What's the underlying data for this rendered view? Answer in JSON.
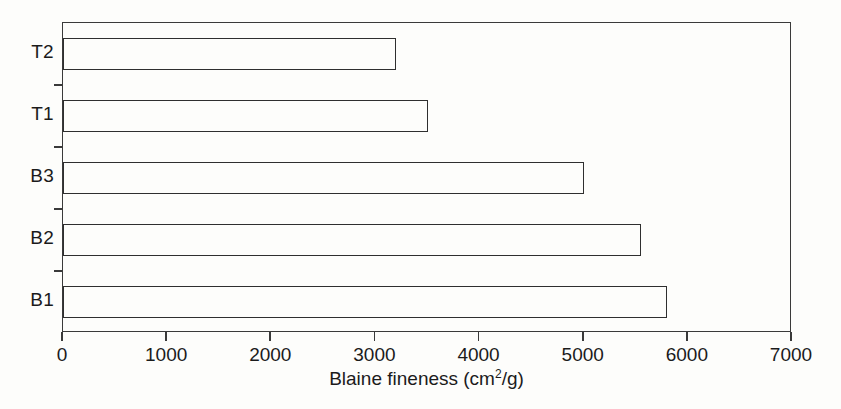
{
  "chart_data": {
    "type": "bar",
    "orientation": "horizontal",
    "title": "",
    "subtitle": "",
    "xlabel": "Blaine fineness (cm2/g)",
    "xlabel_parts": {
      "before": "Blaine fineness (cm",
      "superscript": "2",
      "after": "/g)"
    },
    "ylabel": "",
    "categories": [
      "B1",
      "B2",
      "B3",
      "T1",
      "T2"
    ],
    "categories_top_to_bottom": [
      "T2",
      "T1",
      "B3",
      "B2",
      "B1"
    ],
    "values": [
      5800,
      5550,
      5000,
      3500,
      3200
    ],
    "series": [
      {
        "name": "Blaine fineness",
        "values": [
          5800,
          5550,
          5000,
          3500,
          3200
        ]
      }
    ],
    "xlim": [
      0,
      7000
    ],
    "xticks": [
      0,
      1000,
      2000,
      3000,
      4000,
      5000,
      6000,
      7000
    ],
    "xtick_labels": [
      "0",
      "1000",
      "2000",
      "3000",
      "4000",
      "5000",
      "6000",
      "7000"
    ],
    "grid": false,
    "legend": false,
    "legend_position": "none",
    "bar_style": "unfilled-outline",
    "colors": {
      "bar_edge": "#2f2f2f",
      "bar_fill": "transparent",
      "axis": "#3a3a3a",
      "text": "#1b1b1b",
      "background": "#fdfdfb"
    },
    "bars_top_to_bottom": [
      {
        "label": "T2",
        "value": 3200
      },
      {
        "label": "T1",
        "value": 3500
      },
      {
        "label": "B3",
        "value": 5000
      },
      {
        "label": "B2",
        "value": 5550
      },
      {
        "label": "B1",
        "value": 5800
      }
    ]
  }
}
